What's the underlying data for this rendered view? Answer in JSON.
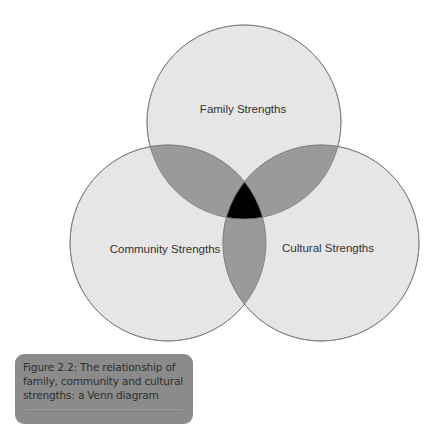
{
  "diagram": {
    "type": "venn",
    "sets": [
      {
        "name": "family",
        "label": "Family Strengths"
      },
      {
        "name": "community",
        "label": "Community Strengths"
      },
      {
        "name": "cultural",
        "label": "Cultural Strengths"
      }
    ],
    "colors": {
      "circle_fill": "#e6e6e6",
      "pair_overlap": "#9a9a9a",
      "triple_overlap": "#000000",
      "stroke": "#7a7a7a"
    }
  },
  "caption": {
    "lines": [
      "Figure 2.2:  The relationship of",
      "family, community and cultural",
      "strengths: a Venn diagram"
    ]
  }
}
